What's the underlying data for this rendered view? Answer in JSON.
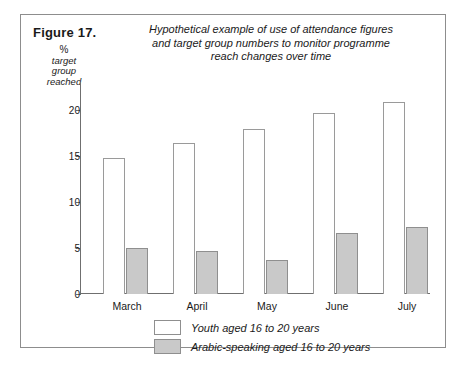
{
  "figure": {
    "label": "Figure 17.",
    "title_lines": [
      "Hypothetical example of use of attendance figures",
      "and target group numbers to monitor programme",
      "reach changes over time"
    ]
  },
  "axis": {
    "y_title_lines": [
      "%",
      "target",
      "group",
      "reached"
    ]
  },
  "legend": {
    "items": [
      {
        "label": "Youth aged 16 to 20 years",
        "color": "#ffffff",
        "key": "youth"
      },
      {
        "label": "Arabic-speaking aged 16 to 20 years",
        "color": "#c9c9c9",
        "key": "arabic"
      }
    ]
  },
  "chart_data": {
    "type": "bar",
    "title": "Hypothetical example of use of attendance figures and target group numbers to monitor programme reach changes over time",
    "xlabel": "",
    "ylabel": "% target group reached",
    "ylim": [
      0,
      21.5
    ],
    "yticks": [
      0,
      5,
      10,
      15,
      20
    ],
    "ytick_labels": [
      "0",
      "5",
      "10",
      "15",
      "20"
    ],
    "grid": false,
    "legend_position": "bottom",
    "categories": [
      "March",
      "April",
      "May",
      "June",
      "July"
    ],
    "series": [
      {
        "name": "Youth aged 16 to 20 years",
        "color": "#ffffff",
        "values": [
          14.8,
          16.4,
          17.9,
          19.7,
          20.8
        ]
      },
      {
        "name": "Arabic-speaking aged 16 to 20 years",
        "color": "#c9c9c9",
        "values": [
          5.0,
          4.7,
          3.7,
          6.6,
          7.3
        ]
      }
    ]
  }
}
